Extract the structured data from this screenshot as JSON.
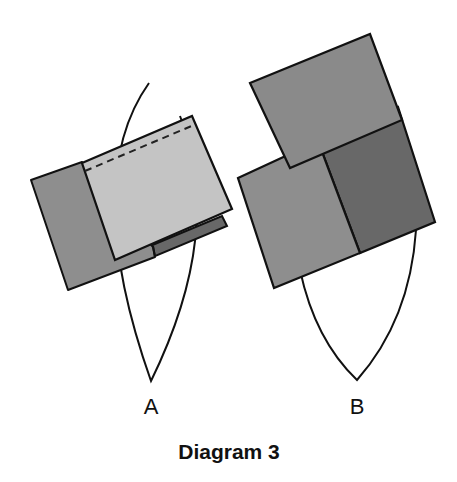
{
  "title": "Diagram 3",
  "colors": {
    "outline": "#111111",
    "light": "#c4c4c4",
    "medium": "#8e8e8e",
    "dark": "#686868",
    "lens_fill": "#ffffff"
  },
  "figures": [
    {
      "id": "A",
      "label": "A",
      "description": "Lens shape with two overlapping rectangles: medium-gray rectangle underneath, light-gray rectangle on top with a dashed fold line near its upper edge, and a dark-gray strip visible below"
    },
    {
      "id": "B",
      "label": "B",
      "description": "Lens shape with three rectangles: a medium-gray rectangle on top, and below it a medium-gray rectangle beside a dark-gray rectangle"
    }
  ]
}
